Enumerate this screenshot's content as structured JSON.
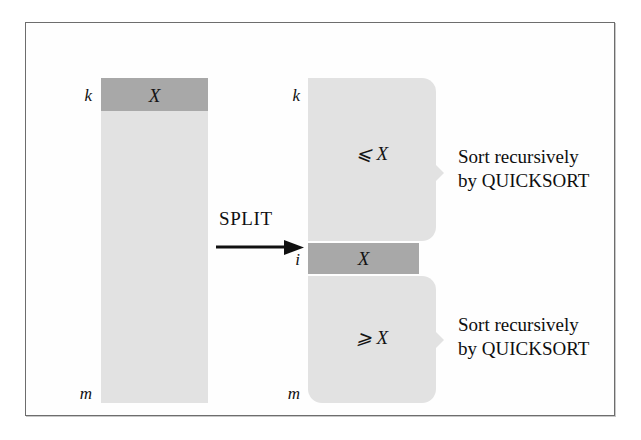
{
  "figure": {
    "colors": {
      "light_block": "#e2e2e2",
      "dark_block": "#a8a8a8",
      "frame_border": "#6d6d6d",
      "text": "#101010",
      "background": "#ffffff"
    }
  },
  "input_column": {
    "top_index_label": "k",
    "bottom_index_label": "m",
    "pivot_label": "X"
  },
  "split": {
    "operation_label": "SPLIT",
    "arrow_icon": "right-arrow-icon"
  },
  "output_column": {
    "top_index_label": "k",
    "pivot_index_label": "i",
    "bottom_index_label": "m",
    "pivot_label": "X",
    "upper_partition_label": "⩽ X",
    "lower_partition_label": "⩾ X"
  },
  "annotations": {
    "upper": {
      "line1": "Sort recursively",
      "line2": "by QUICKSORT"
    },
    "lower": {
      "line1": "Sort recursively",
      "line2": "by QUICKSORT"
    }
  }
}
